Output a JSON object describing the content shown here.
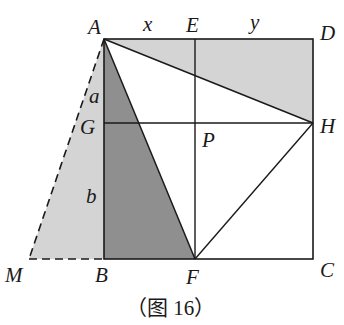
{
  "diagram": {
    "type": "geometry",
    "caption": "（图 16）",
    "points": {
      "A": {
        "label": "A",
        "x": 104,
        "y": 39
      },
      "E": {
        "label": "E",
        "x": 195,
        "y": 39
      },
      "D": {
        "label": "D",
        "x": 313,
        "y": 39
      },
      "G": {
        "label": "G",
        "x": 104,
        "y": 123
      },
      "P": {
        "label": "P",
        "x": 195,
        "y": 123
      },
      "H": {
        "label": "H",
        "x": 313,
        "y": 123
      },
      "M": {
        "label": "M",
        "x": 29,
        "y": 259
      },
      "B": {
        "label": "B",
        "x": 104,
        "y": 259
      },
      "F": {
        "label": "F",
        "x": 195,
        "y": 259
      },
      "C": {
        "label": "C",
        "x": 313,
        "y": 259
      }
    },
    "segment_labels": {
      "AE": "x",
      "ED": "y",
      "AG": "a",
      "GB": "b"
    },
    "regions": [
      {
        "name": "triangle-AMB",
        "fill": "#d4d4d4",
        "style": "light-shaded"
      },
      {
        "name": "triangle-ABF",
        "fill": "#8f8f8f",
        "style": "dark-shaded"
      },
      {
        "name": "triangle-ADH",
        "fill": "#d4d4d4",
        "style": "light-shaded"
      }
    ],
    "colors": {
      "line": "#1a1a1a",
      "light_fill": "#d4d4d4",
      "dark_fill": "#8f8f8f"
    }
  }
}
